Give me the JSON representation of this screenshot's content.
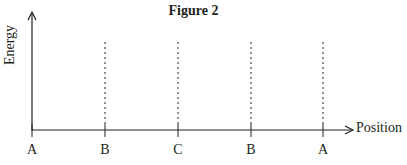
{
  "figure": {
    "title": "Figure 2",
    "y_axis_label": "Energy",
    "x_axis_label": "Position",
    "ticks": [
      {
        "label": "A",
        "x": 32
      },
      {
        "label": "B",
        "x": 105
      },
      {
        "label": "C",
        "x": 178
      },
      {
        "label": "B",
        "x": 251
      },
      {
        "label": "A",
        "x": 323
      }
    ],
    "colors": {
      "line": "#231f20",
      "background": "#ffffff"
    }
  }
}
